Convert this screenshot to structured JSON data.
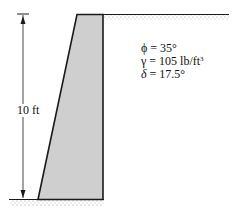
{
  "figure": {
    "type": "retaining-wall-diagram",
    "wall_height_label": "10 ft",
    "parameters": [
      {
        "symbol": "ϕ",
        "value": "= 35°"
      },
      {
        "symbol": "γ",
        "value": "= 105 lb/ft",
        "superscript": "3"
      },
      {
        "symbol": "δ",
        "value": "= 17.5°"
      }
    ],
    "colors": {
      "wall_fill": "#cfcfcf",
      "outline": "#1a1a1a",
      "soil_hatch": "#9a9a9a"
    }
  }
}
